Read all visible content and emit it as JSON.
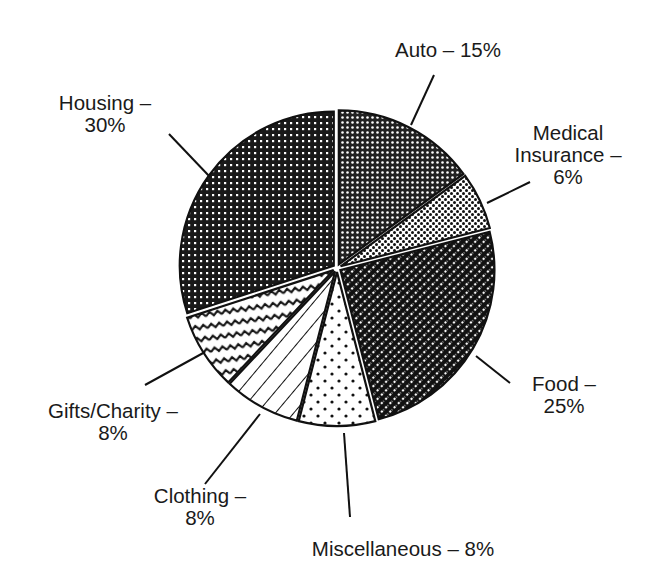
{
  "chart_data": {
    "type": "pie",
    "title": "",
    "exploded": true,
    "start_angle_deg": 0,
    "direction": "clockwise",
    "slices": [
      {
        "label": "Auto",
        "value": 15,
        "display": [
          "Auto – 15%"
        ],
        "pattern": "dense-dots"
      },
      {
        "label": "Medical Insurance",
        "value": 6,
        "display": [
          "Medical",
          "Insurance –",
          "6%"
        ],
        "pattern": "light-dots"
      },
      {
        "label": "Food",
        "value": 25,
        "display": [
          "Food –",
          "25%"
        ],
        "pattern": "diagonal-dots"
      },
      {
        "label": "Miscellaneous",
        "value": 8,
        "display": [
          "Miscellaneous – 8%"
        ],
        "pattern": "sparse-dots"
      },
      {
        "label": "Clothing",
        "value": 8,
        "display": [
          "Clothing –",
          "8%"
        ],
        "pattern": "diagonal-lines"
      },
      {
        "label": "Gifts/Charity",
        "value": 8,
        "display": [
          "Gifts/Charity –",
          "8%"
        ],
        "pattern": "waves"
      },
      {
        "label": "Housing",
        "value": 30,
        "display": [
          "Housing –",
          "30%"
        ],
        "pattern": "grid-dots"
      }
    ],
    "colors": {
      "ink": "#111111",
      "background": "#ffffff"
    }
  }
}
